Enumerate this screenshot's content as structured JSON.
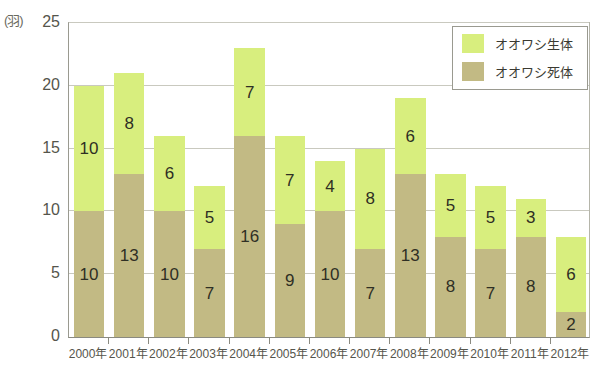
{
  "chart_data": {
    "type": "bar",
    "stacked": true,
    "title": "",
    "xlabel": "",
    "ylabel": "(羽)",
    "unit_label": "(羽)",
    "ylim": [
      0,
      25
    ],
    "yticks": [
      0,
      5,
      10,
      15,
      20,
      25
    ],
    "grid": true,
    "legend_position": "top-right",
    "categories": [
      "2000年",
      "2001年",
      "2002年",
      "2003年",
      "2004年",
      "2005年",
      "2006年",
      "2007年",
      "2008年",
      "2009年",
      "2010年",
      "2011年",
      "2012年"
    ],
    "series": [
      {
        "name": "オオワシ死体",
        "color": "#c2ba84",
        "stack_position": "bottom",
        "values": [
          10,
          13,
          10,
          7,
          16,
          9,
          10,
          7,
          13,
          8,
          7,
          8,
          2
        ]
      },
      {
        "name": "オオワシ生体",
        "color": "#d8ee7e",
        "stack_position": "top",
        "values": [
          10,
          8,
          6,
          5,
          7,
          7,
          4,
          8,
          6,
          5,
          5,
          3,
          6
        ]
      }
    ],
    "totals": [
      20,
      21,
      16,
      12,
      23,
      16,
      14,
      15,
      19,
      13,
      12,
      11,
      8
    ]
  },
  "legend": {
    "items": [
      {
        "label": "オオワシ生体",
        "color": "#d8ee7e"
      },
      {
        "label": "オオワシ死体",
        "color": "#c2ba84"
      }
    ]
  },
  "colors": {
    "live": "#d8ee7e",
    "dead": "#c2ba84",
    "grid": "#c9c9bf",
    "axis": "#8a8a80",
    "text": "#3a3a32"
  }
}
